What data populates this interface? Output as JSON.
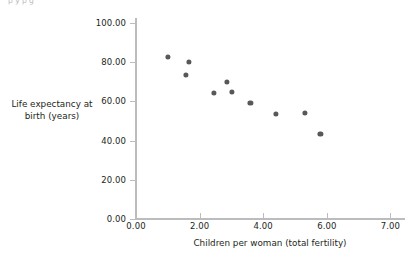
{
  "top_caption": {
    "text": "p         y                  p                                              g"
  },
  "chart_data": {
    "type": "scatter",
    "title": "",
    "subtitle": "",
    "xlabel": "Children per woman (total fertility)",
    "ylabel": "Life expectancy at birth (years)",
    "xlim": [
      0.0,
      8.45
    ],
    "ylim": [
      0.0,
      102.5
    ],
    "grid": false,
    "legend": null,
    "marker_color": "#58585c",
    "axis_color": "#bcbcbe",
    "xticks": [
      0.0,
      2.0,
      4.0,
      6.0,
      8.0
    ],
    "xtick_labels": [
      "0.00",
      "2.00",
      "4.00",
      "6.00",
      "7.00"
    ],
    "yticks": [
      0.0,
      20.0,
      40.0,
      60.0,
      80.0,
      100.0
    ],
    "ytick_labels": [
      "0.00",
      "20.00",
      "40.00",
      "60.00",
      "80.00",
      "100.00"
    ],
    "series": [
      {
        "name": "countries",
        "points": [
          {
            "x": 1.0,
            "y": 82.6
          },
          {
            "x": 1.57,
            "y": 73.5
          },
          {
            "x": 1.67,
            "y": 80.1
          },
          {
            "x": 2.45,
            "y": 64.3
          },
          {
            "x": 2.86,
            "y": 69.9
          },
          {
            "x": 3.02,
            "y": 64.8
          },
          {
            "x": 3.6,
            "y": 59.2
          },
          {
            "x": 4.4,
            "y": 53.6
          },
          {
            "x": 5.3,
            "y": 54.1
          },
          {
            "x": 5.8,
            "y": 43.4
          }
        ]
      }
    ]
  }
}
